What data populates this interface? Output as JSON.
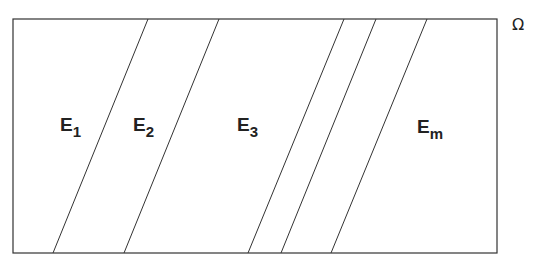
{
  "diagram": {
    "domain_label": "Ω",
    "regions": [
      {
        "letter": "E",
        "sub": "1"
      },
      {
        "letter": "E",
        "sub": "2"
      },
      {
        "letter": "E",
        "sub": "3"
      },
      {
        "letter": "E",
        "sub": "m"
      }
    ],
    "rectangle": {
      "x1": 13,
      "y1": 19,
      "x2": 497,
      "y2": 253
    },
    "dividers": [
      {
        "top_x": 148,
        "bottom_x": 53
      },
      {
        "top_x": 219,
        "bottom_x": 124
      },
      {
        "top_x": 344,
        "bottom_x": 248
      },
      {
        "top_x": 376,
        "bottom_x": 281
      },
      {
        "top_x": 427,
        "bottom_x": 331
      }
    ],
    "line_color": "#333333"
  }
}
